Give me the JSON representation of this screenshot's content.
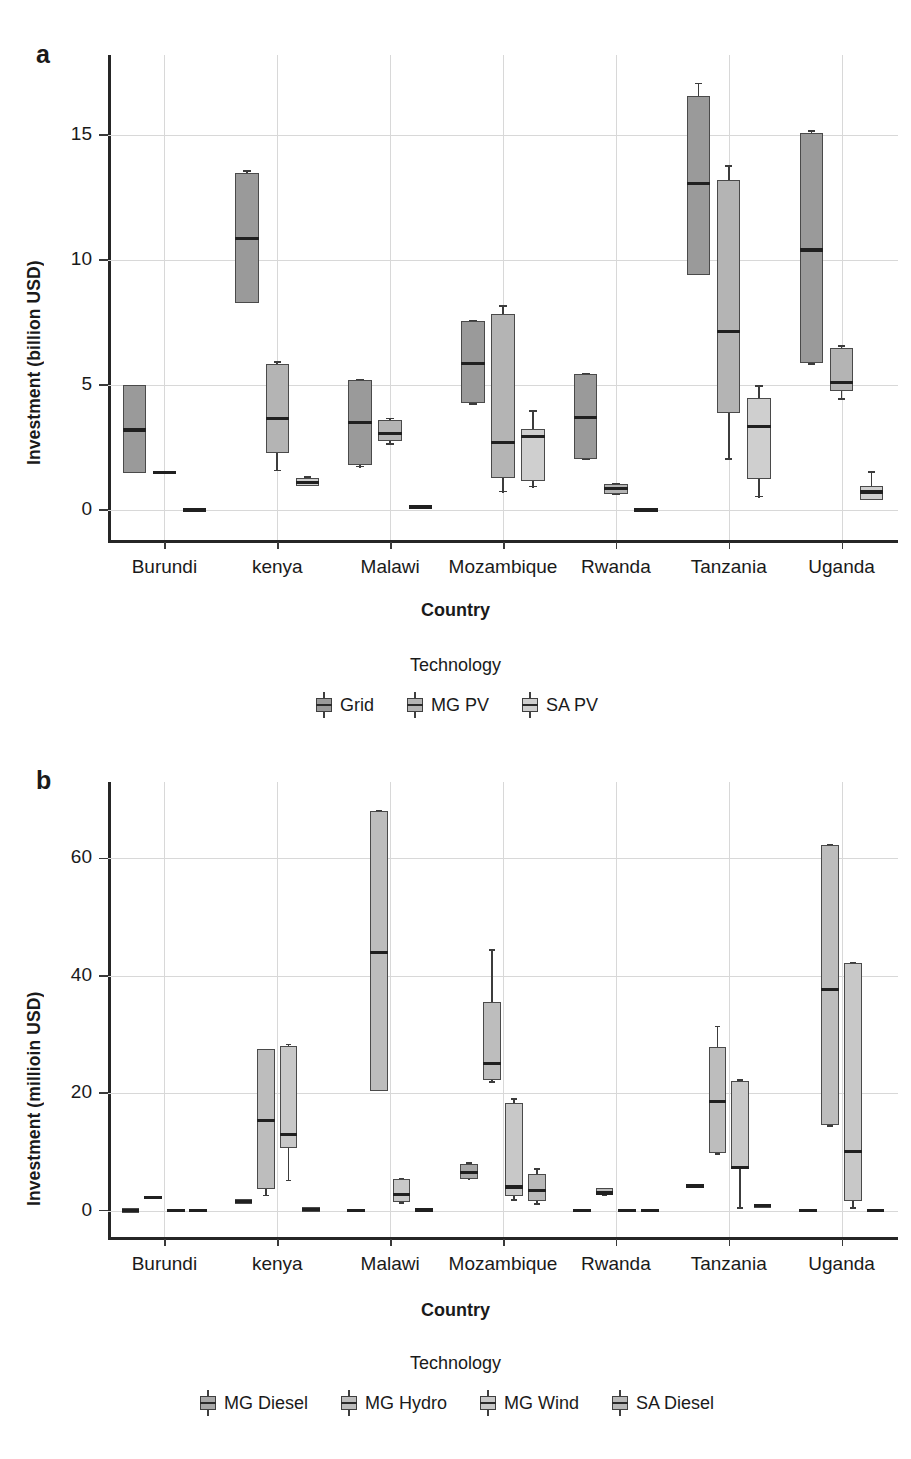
{
  "figure": {
    "panel_a_letter": "a",
    "panel_b_letter": "b"
  },
  "chart_data": [
    {
      "type": "box",
      "panel": "a",
      "title": "",
      "xlabel": "Country",
      "ylabel": "Investment (billion USD)",
      "ylim": [
        -1.2,
        18.2
      ],
      "yticks": [
        0,
        5,
        10,
        15
      ],
      "ytick_labels": [
        "0",
        "5",
        "10",
        "15"
      ],
      "grid": true,
      "legend_title": "Technology",
      "legend_position": "bottom",
      "categories": [
        "Burundi",
        "kenya",
        "Malawi",
        "Mozambique",
        "Rwanda",
        "Tanzania",
        "Uganda"
      ],
      "series": [
        {
          "name": "Grid",
          "color": "#9a9a9a"
        },
        {
          "name": "MG PV",
          "color": "#b4b4b4"
        },
        {
          "name": "SA PV",
          "color": "#cfcfcf"
        }
      ],
      "boxes": [
        {
          "country": "Burundi",
          "tech": "Grid",
          "lower_whisker": 1.5,
          "q1": 1.5,
          "median": 3.2,
          "q3": 5.0,
          "upper_whisker": 5.0
        },
        {
          "country": "Burundi",
          "tech": "MG PV",
          "lower_whisker": 1.45,
          "q1": 1.45,
          "median": 1.5,
          "q3": 1.58,
          "upper_whisker": 1.58
        },
        {
          "country": "Burundi",
          "tech": "SA PV",
          "lower_whisker": -0.05,
          "q1": -0.05,
          "median": 0.0,
          "q3": 0.05,
          "upper_whisker": 0.05
        },
        {
          "country": "kenya",
          "tech": "Grid",
          "lower_whisker": 8.3,
          "q1": 8.3,
          "median": 10.85,
          "q3": 13.5,
          "upper_whisker": 13.6
        },
        {
          "country": "kenya",
          "tech": "MG PV",
          "lower_whisker": 1.55,
          "q1": 2.3,
          "median": 3.65,
          "q3": 5.85,
          "upper_whisker": 5.95
        },
        {
          "country": "kenya",
          "tech": "SA PV",
          "lower_whisker": 0.95,
          "q1": 0.95,
          "median": 1.1,
          "q3": 1.3,
          "upper_whisker": 1.35
        },
        {
          "country": "Malawi",
          "tech": "Grid",
          "lower_whisker": 1.7,
          "q1": 1.8,
          "median": 3.5,
          "q3": 5.2,
          "upper_whisker": 5.25
        },
        {
          "country": "Malawi",
          "tech": "MG PV",
          "lower_whisker": 2.6,
          "q1": 2.75,
          "median": 3.05,
          "q3": 3.6,
          "upper_whisker": 3.7
        },
        {
          "country": "Malawi",
          "tech": "SA PV",
          "lower_whisker": 0.08,
          "q1": 0.08,
          "median": 0.12,
          "q3": 0.16,
          "upper_whisker": 0.16
        },
        {
          "country": "Mozambique",
          "tech": "Grid",
          "lower_whisker": 4.2,
          "q1": 4.3,
          "median": 5.85,
          "q3": 7.55,
          "upper_whisker": 7.6
        },
        {
          "country": "Mozambique",
          "tech": "MG PV",
          "lower_whisker": 0.7,
          "q1": 1.3,
          "median": 2.7,
          "q3": 7.85,
          "upper_whisker": 8.2
        },
        {
          "country": "Mozambique",
          "tech": "SA PV",
          "lower_whisker": 0.9,
          "q1": 1.15,
          "median": 2.95,
          "q3": 3.25,
          "upper_whisker": 4.0
        },
        {
          "country": "Rwanda",
          "tech": "Grid",
          "lower_whisker": 2.0,
          "q1": 2.05,
          "median": 3.7,
          "q3": 5.45,
          "upper_whisker": 5.5
        },
        {
          "country": "Rwanda",
          "tech": "MG PV",
          "lower_whisker": 0.6,
          "q1": 0.65,
          "median": 0.85,
          "q3": 1.05,
          "upper_whisker": 1.1
        },
        {
          "country": "Rwanda",
          "tech": "SA PV",
          "lower_whisker": -0.05,
          "q1": -0.05,
          "median": 0.0,
          "q3": 0.05,
          "upper_whisker": 0.05
        },
        {
          "country": "Tanzania",
          "tech": "Grid",
          "lower_whisker": 9.4,
          "q1": 9.4,
          "median": 13.05,
          "q3": 16.55,
          "upper_whisker": 17.1
        },
        {
          "country": "Tanzania",
          "tech": "MG PV",
          "lower_whisker": 2.0,
          "q1": 3.9,
          "median": 7.15,
          "q3": 13.2,
          "upper_whisker": 13.8
        },
        {
          "country": "Tanzania",
          "tech": "SA PV",
          "lower_whisker": 0.5,
          "q1": 1.25,
          "median": 3.35,
          "q3": 4.5,
          "upper_whisker": 5.0
        },
        {
          "country": "Uganda",
          "tech": "Grid",
          "lower_whisker": 5.8,
          "q1": 5.9,
          "median": 10.4,
          "q3": 15.1,
          "upper_whisker": 15.2
        },
        {
          "country": "Uganda",
          "tech": "MG PV",
          "lower_whisker": 4.4,
          "q1": 4.75,
          "median": 5.1,
          "q3": 6.5,
          "upper_whisker": 6.6
        },
        {
          "country": "Uganda",
          "tech": "SA PV",
          "lower_whisker": 0.4,
          "q1": 0.4,
          "median": 0.72,
          "q3": 0.95,
          "upper_whisker": 1.55
        }
      ]
    },
    {
      "type": "box",
      "panel": "b",
      "title": "",
      "xlabel": "Country",
      "ylabel": "Investment (millioin USD)",
      "ylim": [
        -4.5,
        73
      ],
      "yticks": [
        0,
        20,
        40,
        60
      ],
      "ytick_labels": [
        "0",
        "20",
        "40",
        "60"
      ],
      "grid": true,
      "legend_title": "Technology",
      "legend_position": "bottom",
      "categories": [
        "Burundi",
        "kenya",
        "Malawi",
        "Mozambique",
        "Rwanda",
        "Tanzania",
        "Uganda"
      ],
      "series": [
        {
          "name": "MG Diesel",
          "color": "#a8a8a8"
        },
        {
          "name": "MG Hydro",
          "color": "#bdbdbd"
        },
        {
          "name": "MG Wind",
          "color": "#c8c8c8"
        },
        {
          "name": "SA Diesel",
          "color": "#b8b8b8"
        }
      ],
      "boxes": [
        {
          "country": "Burundi",
          "tech": "MG Diesel",
          "lower_whisker": -0.4,
          "q1": -0.4,
          "median": 0.0,
          "q3": 0.4,
          "upper_whisker": 0.4
        },
        {
          "country": "Burundi",
          "tech": "MG Hydro",
          "lower_whisker": 1.9,
          "q1": 1.9,
          "median": 2.2,
          "q3": 2.5,
          "upper_whisker": 2.5
        },
        {
          "country": "Burundi",
          "tech": "MG Wind",
          "lower_whisker": -0.3,
          "q1": -0.3,
          "median": 0.0,
          "q3": 0.3,
          "upper_whisker": 0.3
        },
        {
          "country": "Burundi",
          "tech": "SA Diesel",
          "lower_whisker": -0.3,
          "q1": -0.3,
          "median": 0.0,
          "q3": 0.3,
          "upper_whisker": 0.3
        },
        {
          "country": "kenya",
          "tech": "MG Diesel",
          "lower_whisker": 1.2,
          "q1": 1.2,
          "median": 1.5,
          "q3": 1.9,
          "upper_whisker": 1.9
        },
        {
          "country": "kenya",
          "tech": "MG Hydro",
          "lower_whisker": 2.4,
          "q1": 3.7,
          "median": 15.4,
          "q3": 27.6,
          "upper_whisker": 27.6
        },
        {
          "country": "kenya",
          "tech": "MG Wind",
          "lower_whisker": 5.0,
          "q1": 10.6,
          "median": 12.9,
          "q3": 28.1,
          "upper_whisker": 28.4
        },
        {
          "country": "kenya",
          "tech": "SA Diesel",
          "lower_whisker": -0.2,
          "q1": -0.2,
          "median": 0.2,
          "q3": 0.6,
          "upper_whisker": 0.6
        },
        {
          "country": "Malawi",
          "tech": "MG Diesel",
          "lower_whisker": -0.3,
          "q1": -0.3,
          "median": 0.0,
          "q3": 0.3,
          "upper_whisker": 0.3
        },
        {
          "country": "Malawi",
          "tech": "MG Hydro",
          "lower_whisker": 20.4,
          "q1": 20.4,
          "median": 43.9,
          "q3": 68.1,
          "upper_whisker": 68.3
        },
        {
          "country": "Malawi",
          "tech": "MG Wind",
          "lower_whisker": 1.2,
          "q1": 1.4,
          "median": 2.8,
          "q3": 5.3,
          "upper_whisker": 5.6
        },
        {
          "country": "Malawi",
          "tech": "SA Diesel",
          "lower_whisker": -0.3,
          "q1": -0.3,
          "median": 0.1,
          "q3": 0.5,
          "upper_whisker": 0.5
        },
        {
          "country": "Mozambique",
          "tech": "MG Diesel",
          "lower_whisker": 5.3,
          "q1": 5.4,
          "median": 6.5,
          "q3": 8.0,
          "upper_whisker": 8.2
        },
        {
          "country": "Mozambique",
          "tech": "MG Hydro",
          "lower_whisker": 21.8,
          "q1": 22.2,
          "median": 25.1,
          "q3": 35.6,
          "upper_whisker": 44.5
        },
        {
          "country": "Mozambique",
          "tech": "MG Wind",
          "lower_whisker": 1.7,
          "q1": 2.4,
          "median": 4.0,
          "q3": 18.4,
          "upper_whisker": 19.1
        },
        {
          "country": "Mozambique",
          "tech": "SA Diesel",
          "lower_whisker": 1.0,
          "q1": 1.6,
          "median": 3.4,
          "q3": 6.2,
          "upper_whisker": 7.2
        },
        {
          "country": "Rwanda",
          "tech": "MG Diesel",
          "lower_whisker": -0.3,
          "q1": -0.3,
          "median": 0.0,
          "q3": 0.3,
          "upper_whisker": 0.3
        },
        {
          "country": "Rwanda",
          "tech": "MG Hydro",
          "lower_whisker": 2.5,
          "q1": 2.6,
          "median": 3.0,
          "q3": 3.8,
          "upper_whisker": 3.9
        },
        {
          "country": "Rwanda",
          "tech": "MG Wind",
          "lower_whisker": -0.3,
          "q1": -0.3,
          "median": 0.0,
          "q3": 0.3,
          "upper_whisker": 0.3
        },
        {
          "country": "Rwanda",
          "tech": "SA Diesel",
          "lower_whisker": -0.3,
          "q1": -0.3,
          "median": 0.0,
          "q3": 0.3,
          "upper_whisker": 0.3
        },
        {
          "country": "Tanzania",
          "tech": "MG Diesel",
          "lower_whisker": 3.8,
          "q1": 3.8,
          "median": 4.2,
          "q3": 4.6,
          "upper_whisker": 4.6
        },
        {
          "country": "Tanzania",
          "tech": "MG Hydro",
          "lower_whisker": 9.5,
          "q1": 9.8,
          "median": 18.6,
          "q3": 27.8,
          "upper_whisker": 31.5
        },
        {
          "country": "Tanzania",
          "tech": "MG Wind",
          "lower_whisker": 0.3,
          "q1": 7.0,
          "median": 7.3,
          "q3": 22.1,
          "upper_whisker": 22.4
        },
        {
          "country": "Tanzania",
          "tech": "SA Diesel",
          "lower_whisker": 0.4,
          "q1": 0.4,
          "median": 0.8,
          "q3": 1.2,
          "upper_whisker": 1.2
        },
        {
          "country": "Uganda",
          "tech": "MG Diesel",
          "lower_whisker": -0.3,
          "q1": -0.3,
          "median": 0.0,
          "q3": 0.3,
          "upper_whisker": 0.3
        },
        {
          "country": "Uganda",
          "tech": "MG Hydro",
          "lower_whisker": 14.3,
          "q1": 14.5,
          "median": 37.6,
          "q3": 62.2,
          "upper_whisker": 62.4
        },
        {
          "country": "Uganda",
          "tech": "MG Wind",
          "lower_whisker": 0.3,
          "q1": 1.6,
          "median": 10.1,
          "q3": 42.2,
          "upper_whisker": 42.4
        },
        {
          "country": "Uganda",
          "tech": "SA Diesel",
          "lower_whisker": -0.3,
          "q1": -0.3,
          "median": 0.0,
          "q3": 0.3,
          "upper_whisker": 0.3
        }
      ]
    }
  ]
}
